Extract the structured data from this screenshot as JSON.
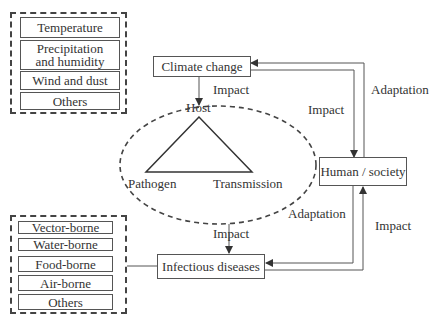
{
  "climate_factors": {
    "items": [
      {
        "label": "Temperature"
      },
      {
        "label": "Precipitation and humidity",
        "line1": "Precipitation",
        "line2": "and humidity"
      },
      {
        "label": "Wind and dust"
      },
      {
        "label": "Others"
      }
    ]
  },
  "disease_types": {
    "items": [
      {
        "label": "Vector-borne"
      },
      {
        "label": "Water-borne"
      },
      {
        "label": "Food-borne"
      },
      {
        "label": "Air-borne"
      },
      {
        "label": "Others"
      }
    ]
  },
  "nodes": {
    "climate_change": "Climate change",
    "human_society": "Human / society",
    "infectious_diseases": "Infectious diseases"
  },
  "triad": {
    "host": "Host",
    "pathogen": "Pathogen",
    "transmission": "Transmission"
  },
  "edges": {
    "climate_to_triad": "Impact",
    "climate_to_human": "Impact",
    "human_to_climate": "Adaptation",
    "triad_to_diseases": "Impact",
    "human_to_diseases": "Adaptation",
    "diseases_to_human": "Impact"
  },
  "colors": {
    "line": "#444444",
    "text": "#333333",
    "background": "#ffffff"
  }
}
